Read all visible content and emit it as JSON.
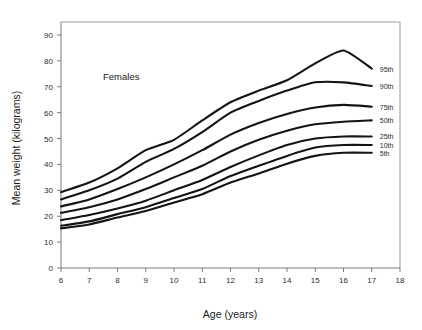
{
  "chart_data": {
    "type": "line",
    "title": "",
    "annotation": "Females",
    "xlabel": "Age (years)",
    "ylabel": "Mean weight (kilograms)",
    "xlim": [
      6,
      18
    ],
    "ylim": [
      0,
      95
    ],
    "xticks": [
      6,
      7,
      8,
      9,
      10,
      11,
      12,
      13,
      14,
      15,
      16,
      17,
      18
    ],
    "yticks": [
      0,
      10,
      20,
      30,
      40,
      50,
      60,
      70,
      80,
      90
    ],
    "grid": false,
    "legend_position": "right",
    "x": [
      6,
      7,
      8,
      9,
      10,
      11,
      12,
      13,
      14,
      15,
      16,
      17
    ],
    "series": [
      {
        "name": "95th",
        "values": [
          29.3,
          33.0,
          38.5,
          45.5,
          49.5,
          57.0,
          64.0,
          68.5,
          72.5,
          79.0,
          84.0,
          77.0
        ]
      },
      {
        "name": "90th",
        "values": [
          26.5,
          30.0,
          34.5,
          41.0,
          46.0,
          52.5,
          60.0,
          64.5,
          68.5,
          71.7,
          71.7,
          70.3
        ]
      },
      {
        "name": "75th",
        "values": [
          23.8,
          26.5,
          30.5,
          35.0,
          40.0,
          45.5,
          51.5,
          56.0,
          59.5,
          62.0,
          63.0,
          62.3
        ]
      },
      {
        "name": "50th",
        "values": [
          21.3,
          23.5,
          26.5,
          30.5,
          35.0,
          39.5,
          45.0,
          49.5,
          53.0,
          55.5,
          56.5,
          57.0
        ]
      },
      {
        "name": "25th",
        "values": [
          18.5,
          20.5,
          23.0,
          26.0,
          30.0,
          34.0,
          39.0,
          43.5,
          47.5,
          50.0,
          50.8,
          50.8
        ]
      },
      {
        "name": "10th",
        "values": [
          16.3,
          18.0,
          20.8,
          23.5,
          27.0,
          30.5,
          35.5,
          39.5,
          43.3,
          46.5,
          47.5,
          47.5
        ]
      },
      {
        "name": "5th",
        "values": [
          15.3,
          16.8,
          19.5,
          22.0,
          25.3,
          28.5,
          33.0,
          36.5,
          40.3,
          43.3,
          44.5,
          44.5
        ]
      }
    ]
  }
}
